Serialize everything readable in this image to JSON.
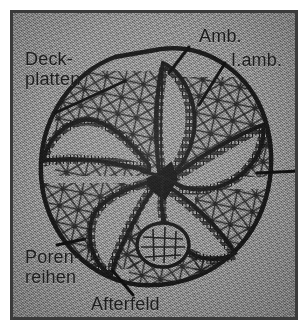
{
  "figure": {
    "kind": "scientific-illustration",
    "frame_color": "#3a3a3a",
    "background_color": "#8c8c8c",
    "ink_color": "#191919",
    "label_color": "#1d1d1d"
  },
  "labels": {
    "deckplatten": "Deck-\nplatten",
    "porenreihen": "Poren-\nreihen",
    "amb": "Amb.",
    "iamb": "I.amb.",
    "afterfeld": "Afterfeld"
  },
  "leaders": {
    "deckplatten": "leader-line-deckplatten",
    "porenreihen": "leader-line-porenreihen",
    "amb": "leader-line-amb",
    "iamb": "leader-line-iamb",
    "afterfeld": "leader-line-afterfeld",
    "right_stub": "leader-line-right-stub"
  }
}
